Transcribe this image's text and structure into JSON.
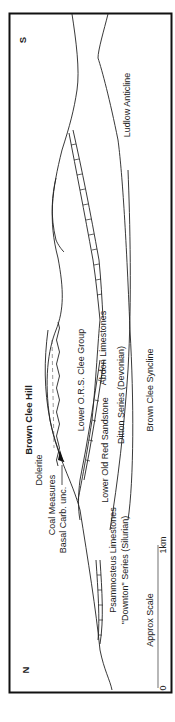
{
  "diagram": {
    "type": "geological-cross-section",
    "orientation": "rotated-90-ccw",
    "ends": {
      "north": "N",
      "south": "S"
    },
    "title": "Brown Clee Hill",
    "labels": {
      "ludlow_anticline": "Ludlow Anticline",
      "brown_clee_syncline": "Brown Clee Syncline",
      "abdon_limestones": "Abdon Limestones",
      "ditton_series": "Ditton Series (Devonian)",
      "lower_ors_clee": "Lower O.R.S. Clee Group",
      "lower_old_red": "Lower Old Red Sandstone",
      "dolerite": "Dolerite",
      "coal_measures": "Coal Measures",
      "basal_carb": "Basal Carb. unc.",
      "psammosteus": "Psammosteus Limestones",
      "downton": "\"Downton\" Series (Silurian)"
    },
    "scale": {
      "label": "Approx Scale",
      "start": "0",
      "end": "1km"
    },
    "colors": {
      "ink": "#222222",
      "background": "#ffffff",
      "scale_bar": "#888888"
    }
  }
}
